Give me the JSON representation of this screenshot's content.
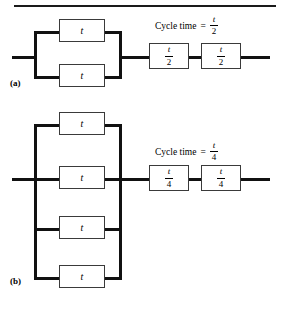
{
  "figure": {
    "panels": [
      {
        "id": "a",
        "label": "(a)",
        "caption": {
          "text": "Cycle time",
          "equals": "=",
          "numerator": "t",
          "denominator": "2"
        },
        "parallel_stations": [
          {
            "numerator": "t",
            "denominator": ""
          },
          {
            "numerator": "t",
            "denominator": ""
          }
        ],
        "series_stations": [
          {
            "numerator": "t",
            "denominator": "2"
          },
          {
            "numerator": "t",
            "denominator": "2"
          }
        ]
      },
      {
        "id": "b",
        "label": "(b)",
        "caption": {
          "text": "Cycle time",
          "equals": "=",
          "numerator": "t",
          "denominator": "4"
        },
        "parallel_stations": [
          {
            "numerator": "t",
            "denominator": ""
          },
          {
            "numerator": "t",
            "denominator": ""
          },
          {
            "numerator": "t",
            "denominator": ""
          },
          {
            "numerator": "t",
            "denominator": ""
          }
        ],
        "series_stations": [
          {
            "numerator": "t",
            "denominator": "4"
          },
          {
            "numerator": "t",
            "denominator": "4"
          }
        ]
      }
    ],
    "colors": {
      "line": "#111111",
      "box_border": "#3a3a3a",
      "background": "#ffffff"
    }
  }
}
